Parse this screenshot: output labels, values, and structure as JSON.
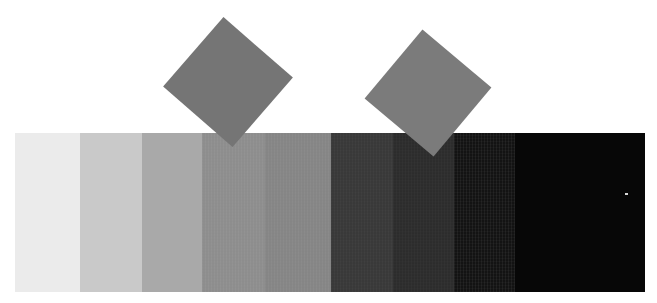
{
  "image": {
    "title": "Grayscale Step Wedge Test Chart",
    "width": 657,
    "height": 303,
    "background_color": "#ffffff"
  },
  "wedge": {
    "label": "grayscale step wedge",
    "left": 15,
    "top": 133,
    "width": 630,
    "height": 159,
    "patch_count": 9,
    "patches": [
      {
        "index": 1,
        "name": "patch-1",
        "color": "#ebebeb",
        "gray_value": 235,
        "x": 15,
        "width": 65,
        "noise": "none"
      },
      {
        "index": 2,
        "name": "patch-2",
        "color": "#c9c9c9",
        "gray_value": 201,
        "x": 80,
        "width": 62,
        "noise": "none"
      },
      {
        "index": 3,
        "name": "patch-3",
        "color": "#a9a9a9",
        "gray_value": 169,
        "x": 142,
        "width": 60,
        "noise": "none"
      },
      {
        "index": 4,
        "name": "patch-4",
        "color": "#919191",
        "gray_value": 145,
        "x": 202,
        "width": 63,
        "noise": "light"
      },
      {
        "index": 5,
        "name": "patch-5",
        "color": "#898989",
        "gray_value": 137,
        "x": 265,
        "width": 66,
        "noise": "light"
      },
      {
        "index": 6,
        "name": "patch-6",
        "color": "#3b3b3b",
        "gray_value": 59,
        "x": 331,
        "width": 62,
        "noise": "light"
      },
      {
        "index": 7,
        "name": "patch-7",
        "color": "#2e2e2e",
        "gray_value": 46,
        "x": 393,
        "width": 61,
        "noise": "light"
      },
      {
        "index": 8,
        "name": "patch-8",
        "color": "#151515",
        "gray_value": 21,
        "x": 454,
        "width": 61,
        "noise": "heavy"
      },
      {
        "index": 9,
        "name": "patch-9",
        "color": "#070707",
        "gray_value": 7,
        "x": 515,
        "width": 130,
        "noise": "none"
      }
    ]
  },
  "diamonds": [
    {
      "name": "diamond-left",
      "color": "#757575",
      "gray_value": 117,
      "center_x": 228,
      "center_y": 82,
      "size": 92,
      "rotation_deg": -4
    },
    {
      "name": "diamond-right",
      "color": "#7b7b7b",
      "gray_value": 123,
      "center_x": 428,
      "center_y": 93,
      "size": 90,
      "rotation_deg": -5
    }
  ],
  "artifacts": [
    {
      "name": "hot-pixel-speck",
      "color": "#d8d8d8",
      "x": 625,
      "y": 193,
      "width": 3,
      "height": 2
    }
  ]
}
